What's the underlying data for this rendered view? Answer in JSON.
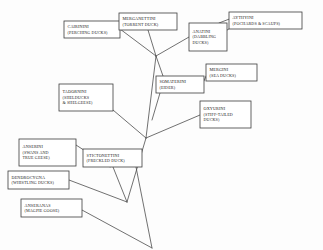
{
  "diagram": {
    "type": "phylogenetic-tree",
    "background_color": "#fdfdfd",
    "line_color": "#4c4c4c",
    "box_fill": "#ffffff",
    "box_stroke": "#3d3d3d",
    "nodes": [
      {
        "id": "cairinini",
        "name": "CAIRININI",
        "common": "(PERCHING DUCKS)",
        "x": 64,
        "y": 21,
        "w": 56,
        "h": 17
      },
      {
        "id": "merganettini",
        "name": "MERGANETTINI",
        "common": "(TORRENT DUCK)",
        "x": 119,
        "y": 13,
        "w": 58,
        "h": 17
      },
      {
        "id": "anatini",
        "name": "ANATINI",
        "common": "(DABBLING",
        "common2": "DUCKS)",
        "x": 189,
        "y": 23,
        "w": 38,
        "h": 28
      },
      {
        "id": "aythyini",
        "name": "AYTHYINI",
        "common": "(POCHARDS & SCAUPS)",
        "x": 229,
        "y": 12,
        "w": 73,
        "h": 17
      },
      {
        "id": "mergini",
        "name": "MERGINI",
        "common": "(SEA DUCKS)",
        "x": 206,
        "y": 64,
        "w": 51,
        "h": 17
      },
      {
        "id": "somaterini",
        "name": "SOMATERINI",
        "common": "(EIDER)",
        "x": 156,
        "y": 76,
        "w": 48,
        "h": 17
      },
      {
        "id": "oxyurini",
        "name": "OXYURINI",
        "common": "(STIFF-TAILED",
        "common2": "DUCKS)",
        "x": 200,
        "y": 101,
        "w": 51,
        "h": 27
      },
      {
        "id": "tadornini",
        "name": "TADORNINI",
        "common": "(SHELDUCKS",
        "common2": "& SHELGEESE)",
        "x": 59,
        "y": 84,
        "w": 54,
        "h": 27
      },
      {
        "id": "anserini",
        "name": "ANSERINI",
        "common": "(SWANS AND",
        "common2": "TRUE GEESE)",
        "x": 19,
        "y": 139,
        "w": 57,
        "h": 27
      },
      {
        "id": "stictonettini",
        "name": "STICTONETTINI",
        "common": "(FRECKLED DUCK)",
        "x": 83,
        "y": 149,
        "w": 59,
        "h": 18
      },
      {
        "id": "dendrocygna",
        "name": "DENDROCYGNA",
        "common": "(WHISTLING DUCKS)",
        "x": 8,
        "y": 171,
        "w": 61,
        "h": 18
      },
      {
        "id": "anseranas",
        "name": "ANSERANAS",
        "common": "(MAGPIE GOOSE)",
        "x": 21,
        "y": 199,
        "w": 61,
        "h": 18
      }
    ],
    "junctions": [
      {
        "id": "j-upper",
        "x": 156,
        "y": 56
      },
      {
        "id": "j-mid",
        "x": 146,
        "y": 138
      },
      {
        "id": "j-lower",
        "x": 127,
        "y": 202
      },
      {
        "id": "j-base",
        "x": 152,
        "y": 248
      }
    ],
    "edges": [
      {
        "from": "cairinini",
        "to": "j-upper",
        "x1": 120,
        "y1": 29,
        "x2": 156,
        "y2": 56
      },
      {
        "from": "merganettini",
        "to": "j-upper",
        "x1": 148,
        "y1": 30,
        "x2": 156,
        "y2": 56
      },
      {
        "from": "anatini",
        "to": "j-upper",
        "x1": 189,
        "y1": 37,
        "x2": 156,
        "y2": 56
      },
      {
        "from": "anatini",
        "to": "aythyini",
        "x1": 219,
        "y1": 23,
        "x2": 232,
        "y2": 18
      },
      {
        "from": "anatini",
        "to": "aythyini-2",
        "x1": 224,
        "y1": 32,
        "x2": 232,
        "y2": 27
      },
      {
        "from": "somaterini",
        "to": "mergini",
        "x1": 204,
        "y1": 81,
        "x2": 206,
        "y2": 76
      },
      {
        "from": "somaterini",
        "to": "j-upper",
        "x1": 163,
        "y1": 76,
        "x2": 156,
        "y2": 56
      },
      {
        "from": "somaterini-stem",
        "to": "j-mid",
        "x1": 160,
        "y1": 93,
        "x2": 152,
        "y2": 120
      },
      {
        "from": "oxyurini",
        "to": "j-mid",
        "x1": 200,
        "y1": 115,
        "x2": 146,
        "y2": 138
      },
      {
        "from": "tadornini",
        "to": "j-mid",
        "x1": 113,
        "y1": 110,
        "x2": 146,
        "y2": 138
      },
      {
        "from": "j-upper",
        "to": "j-mid",
        "x1": 156,
        "y1": 56,
        "x2": 146,
        "y2": 138
      },
      {
        "from": "j-mid",
        "to": "j-lower",
        "x1": 146,
        "y1": 138,
        "x2": 127,
        "y2": 202
      },
      {
        "from": "stictonettini",
        "to": "j-lower",
        "x1": 113,
        "y1": 167,
        "x2": 127,
        "y2": 202
      },
      {
        "from": "stictonettini-right",
        "to": "j-base",
        "x1": 136,
        "y1": 167,
        "x2": 152,
        "y2": 248
      },
      {
        "from": "anserini",
        "to": "stictonettini",
        "x1": 76,
        "y1": 145,
        "x2": 110,
        "y2": 167
      },
      {
        "from": "dendrocygna",
        "to": "j-lower",
        "x1": 69,
        "y1": 180,
        "x2": 127,
        "y2": 202
      },
      {
        "from": "anseranas",
        "to": "j-base",
        "x1": 82,
        "y1": 210,
        "x2": 152,
        "y2": 248
      }
    ]
  }
}
